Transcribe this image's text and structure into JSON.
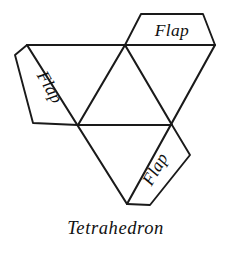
{
  "figure": {
    "caption": "Tetrahedron",
    "background_color": "#ffffff",
    "ink_color": "#1a1a1a"
  },
  "flaps": [
    {
      "id": "top",
      "label": "Flap",
      "rotation_deg": 0,
      "attached_edge": "top-right outer edge"
    },
    {
      "id": "left",
      "label": "Flap",
      "rotation_deg": 60,
      "attached_edge": "upper-left outer edge"
    },
    {
      "id": "bottom-right",
      "label": "Flap",
      "rotation_deg": -60,
      "attached_edge": "lower-right outer edge"
    }
  ],
  "geometry": {
    "outer_triangle": {
      "apex_top_left": [
        27,
        45
      ],
      "apex_top_right": [
        215,
        45
      ],
      "apex_bottom": [
        127,
        204
      ]
    },
    "midpoints": {
      "top": [
        125,
        45
      ],
      "left": [
        78,
        125
      ],
      "right": [
        172,
        125
      ]
    },
    "flap_outer_points": {
      "top": [
        [
          141,
          14
        ],
        [
          203,
          14
        ]
      ],
      "left": [
        [
          15,
          55
        ],
        [
          33,
          123
        ]
      ],
      "bottom_right": [
        [
          190,
          155
        ],
        [
          150,
          205
        ]
      ]
    }
  }
}
